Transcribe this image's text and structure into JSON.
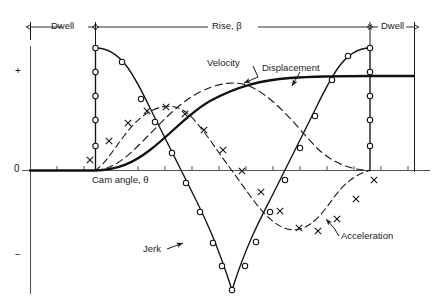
{
  "figure": {
    "background": "#ffffff",
    "ink": "#1a1a1a"
  },
  "axis": {
    "y_plus_label": "+",
    "y_zero_label": "0",
    "y_minus_label": "−",
    "x_axis_label": "Cam angle, θ"
  },
  "spans": [
    {
      "name": "dwell-left",
      "label": "Dwell",
      "x0": 30,
      "x1": 95
    },
    {
      "name": "rise",
      "label": "Rise, β",
      "label_italic_part": "β",
      "x0": 95,
      "x1": 370
    },
    {
      "name": "dwell-right",
      "label": "Dwell",
      "x0": 370,
      "x1": 415
    }
  ],
  "curve_labels": {
    "velocity": "Velocity",
    "displacement": "Displacement",
    "jerk": "Jerk",
    "acceleration": "Acceleration"
  },
  "chart_data": {
    "type": "line",
    "xlabel": "Cam angle, θ",
    "ylabel": "",
    "xlim": [
      0,
      1
    ],
    "ylim": [
      -1.25,
      1.25
    ],
    "grid": false,
    "legend": "inline-annotations",
    "x_tick_count": 15,
    "y_ticks": [
      "+",
      "0",
      "−"
    ],
    "motion_law": "cycloidal",
    "regions": {
      "dwell_left": [
        0.0,
        0.19
      ],
      "rise": [
        0.19,
        1.0
      ],
      "dwell_right": [
        1.0,
        1.13
      ]
    },
    "series": [
      {
        "name": "Displacement",
        "style": "thick-solid",
        "marker": "none",
        "description": "S-curve rising smoothly from 0 to maximum over the rise interval, flat in both dwells",
        "x": [
          0.0,
          0.1,
          0.19,
          0.28,
          0.37,
          0.46,
          0.55,
          0.64,
          0.73,
          0.82,
          0.91,
          1.0,
          1.13
        ],
        "y": [
          0.0,
          0.0,
          0.0,
          0.04,
          0.15,
          0.32,
          0.5,
          0.68,
          0.85,
          0.96,
          1.0,
          1.0,
          1.0
        ]
      },
      {
        "name": "Velocity",
        "style": "dashed",
        "marker": "none",
        "description": "Raised-cosine hump, zero at both ends of rise, peak at mid-rise",
        "x": [
          0.19,
          0.28,
          0.37,
          0.46,
          0.55,
          0.64,
          0.73,
          0.82,
          0.91,
          1.0
        ],
        "y": [
          0.0,
          0.21,
          0.6,
          0.91,
          1.0,
          0.91,
          0.6,
          0.21,
          0.03,
          0.0
        ]
      },
      {
        "name": "Acceleration",
        "style": "dashed",
        "marker": "cross",
        "description": "Full sine wave over the rise: positive hump then negative hump, zero at mid-rise",
        "x": [
          0.19,
          0.24,
          0.3,
          0.36,
          0.42,
          0.48,
          0.55,
          0.62,
          0.68,
          0.74,
          0.8,
          0.86,
          0.93,
          1.0
        ],
        "y": [
          0.0,
          0.45,
          0.78,
          0.8,
          0.6,
          0.3,
          0.0,
          -0.32,
          -0.6,
          -0.8,
          -0.78,
          -0.52,
          -0.22,
          0.0
        ]
      },
      {
        "name": "Jerk",
        "style": "solid",
        "marker": "circle",
        "description": "Cosine wave with step discontinuities: jumps to +max at start of rise, falls to -max at mid-rise, returns to +max and drops to zero at end of rise",
        "x": [
          0.19,
          0.19,
          0.23,
          0.27,
          0.31,
          0.36,
          0.41,
          0.46,
          0.5,
          0.55,
          0.6,
          0.65,
          0.7,
          0.75,
          0.8,
          0.86,
          0.92,
          0.97,
          1.0,
          1.0
        ],
        "y": [
          0.0,
          1.0,
          0.96,
          0.8,
          0.52,
          0.14,
          -0.3,
          -0.7,
          -0.93,
          -1.05,
          -1.05,
          -0.93,
          -0.7,
          -0.3,
          0.14,
          0.58,
          0.88,
          1.0,
          1.0,
          0.0
        ]
      }
    ]
  }
}
